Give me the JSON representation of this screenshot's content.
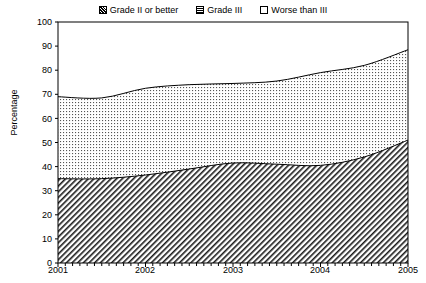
{
  "chart_data": {
    "type": "area",
    "stacked": true,
    "title": "",
    "xlabel": "",
    "ylabel": "Percentage",
    "xlim": [
      2001,
      2005
    ],
    "ylim": [
      0,
      100
    ],
    "grid": false,
    "legend_position": "top-center",
    "x": [
      2001,
      2001.5,
      2002,
      2002.5,
      2003,
      2003.5,
      2004,
      2004.5,
      2005
    ],
    "xtick_labels": [
      "2001",
      "2002",
      "2003",
      "2004",
      "2005"
    ],
    "ytick_labels": [
      "0",
      "10",
      "20",
      "30",
      "40",
      "50",
      "60",
      "70",
      "80",
      "90",
      "100"
    ],
    "ytick_values": [
      0,
      10,
      20,
      30,
      40,
      50,
      60,
      70,
      80,
      90,
      100
    ],
    "series": [
      {
        "name": "Grade II or better",
        "pattern": "diagonal-hatch",
        "values": [
          35,
          35,
          36.5,
          39,
          41.5,
          41,
          40.5,
          44,
          51
        ]
      },
      {
        "name": "Grade III",
        "pattern": "dotted-grid",
        "values": [
          34,
          33.5,
          36,
          35,
          33,
          34.5,
          38.5,
          38,
          37.5
        ]
      },
      {
        "name": "Worse than III",
        "pattern": "none",
        "values": [
          31,
          31.5,
          27.5,
          26,
          25.5,
          24.5,
          21,
          18,
          11.5
        ]
      }
    ],
    "cumulative_upper_grade2": [
      35,
      35,
      36.5,
      39,
      41.5,
      41,
      40.5,
      44,
      51
    ],
    "cumulative_upper_grade3": [
      69,
      68.5,
      72.5,
      74,
      74.5,
      75.5,
      79,
      82,
      88.5
    ]
  },
  "legend": {
    "items": [
      {
        "label": "Grade II or better",
        "swatch": "hatch-swatch"
      },
      {
        "label": "Grade III",
        "swatch": "dots-swatch"
      },
      {
        "label": "Worse than III",
        "swatch": "plain-swatch"
      }
    ]
  },
  "axes": {
    "y_title": "Percentage"
  }
}
